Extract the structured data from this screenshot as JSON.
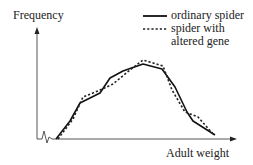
{
  "chart_data": {
    "type": "line",
    "title": "",
    "xlabel": "Adult weight",
    "ylabel": "Frequency",
    "grid": false,
    "axis_break_on_x": true,
    "legend": {
      "position": "top-right",
      "entries": [
        {
          "label": "ordinary spider",
          "style": "solid"
        },
        {
          "label": "spider with altered gene",
          "style": "dashed"
        }
      ]
    },
    "series": [
      {
        "name": "ordinary spider",
        "style": "solid",
        "points_px": [
          [
            56,
            139
          ],
          [
            70,
            121
          ],
          [
            80,
            103
          ],
          [
            100,
            93
          ],
          [
            110,
            78
          ],
          [
            123,
            71
          ],
          [
            143,
            64
          ],
          [
            162,
            69
          ],
          [
            175,
            87
          ],
          [
            187,
            112
          ],
          [
            193,
            121
          ],
          [
            215,
            135
          ]
        ]
      },
      {
        "name": "spider with altered gene",
        "style": "dashed",
        "points_px": [
          [
            58,
            139
          ],
          [
            73,
            119
          ],
          [
            83,
            97
          ],
          [
            98,
            91
          ],
          [
            113,
            84
          ],
          [
            130,
            70
          ],
          [
            143,
            60
          ],
          [
            163,
            66
          ],
          [
            172,
            90
          ],
          [
            185,
            112
          ],
          [
            198,
            117
          ],
          [
            213,
            134
          ]
        ]
      }
    ]
  },
  "labels": {
    "y_axis": "Frequency",
    "x_axis": "Adult weight",
    "legend_line1": "ordinary spider",
    "legend_line2": "spider with",
    "legend_line3": "altered gene"
  }
}
